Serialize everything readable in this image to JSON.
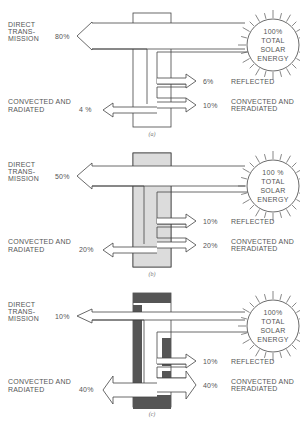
{
  "figure": {
    "panels": [
      {
        "caption": "(a)",
        "glass_fill": "#ffffff",
        "sun": [
          "100%",
          "TOTAL",
          "SOLAR",
          "ENERGY"
        ],
        "direct": {
          "label": [
            "DIRECT",
            "TRANS-",
            "MISSION"
          ],
          "value": "80%"
        },
        "inside": {
          "label": [
            "CONVECTED AND",
            "RADIATED"
          ],
          "value": "4 %"
        },
        "reflected": {
          "label": "REFLECTED",
          "value": "6%"
        },
        "outside": {
          "label": [
            "CONVECTED AND",
            "RERADIATED"
          ],
          "value": "10%"
        }
      },
      {
        "caption": "(b)",
        "glass_fill": "#dcdcdc",
        "sun": [
          "100 %",
          "TOTAL",
          "SOLAR",
          "ENERGY"
        ],
        "direct": {
          "label": [
            "DIRECT",
            "TRANS-",
            "MISSION"
          ],
          "value": "50%"
        },
        "inside": {
          "label": [
            "CONVECTED AND",
            "RADIATED"
          ],
          "value": "20%"
        },
        "reflected": {
          "label": "REFLECTED",
          "value": "10%"
        },
        "outside": {
          "label": [
            "CONVECTED AND",
            "RERADIATED"
          ],
          "value": "20%"
        }
      },
      {
        "caption": "(c)",
        "glass_fill": "#555555",
        "sun": [
          "100%",
          "TOTAL",
          "SOLAR",
          "ENERGY"
        ],
        "direct": {
          "label": [
            "DIRECT",
            "TRANS-",
            "MISSION"
          ],
          "value": "10%"
        },
        "inside": {
          "label": [
            "CONVECTED AND",
            "RADIATED"
          ],
          "value": "40%"
        },
        "reflected": {
          "label": "REFLECTED",
          "value": "10%"
        },
        "outside": {
          "label": [
            "CONVECTED AND",
            "RERADIATED"
          ],
          "value": "40%"
        }
      }
    ]
  }
}
